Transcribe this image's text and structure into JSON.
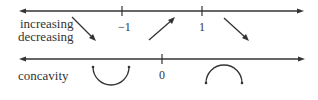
{
  "sign_chart": {
    "first_derivative": {
      "row_labels": [
        "increasing",
        "decreasing"
      ],
      "critical_points": [
        {
          "label": "−1",
          "x": -1
        },
        {
          "label": "1",
          "x": 1
        }
      ],
      "intervals": [
        {
          "range": "(-∞, -1)",
          "behavior": "decreasing",
          "arrow": "down-right"
        },
        {
          "range": "(-1, 1)",
          "behavior": "increasing",
          "arrow": "up-right"
        },
        {
          "range": "(1, ∞)",
          "behavior": "decreasing",
          "arrow": "down-right"
        }
      ]
    },
    "second_derivative": {
      "row_label": "concavity",
      "critical_points": [
        {
          "label": "0",
          "x": 0
        }
      ],
      "intervals": [
        {
          "range": "(-∞, 0)",
          "concavity": "concave up",
          "symbol": "cup"
        },
        {
          "range": "(0, ∞)",
          "concavity": "concave down",
          "symbol": "cap"
        }
      ]
    }
  },
  "colors": {
    "line": "#333333",
    "background": "#ffffff"
  }
}
